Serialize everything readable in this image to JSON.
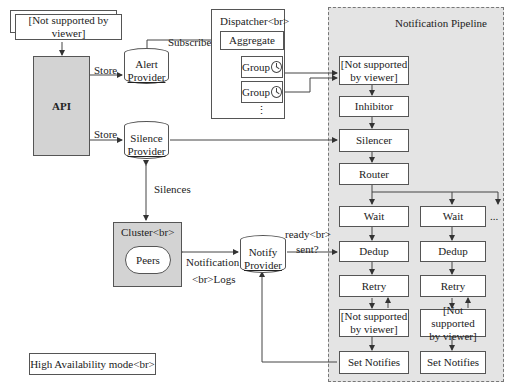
{
  "diagram": {
    "top_left_stack": {
      "label": "[Not supported by viewer]"
    },
    "api": {
      "label": "API"
    },
    "alert_provider": {
      "label_line1": "Alert",
      "label_line2": "Provider"
    },
    "silence_provider": {
      "label_line1": "Silence",
      "label_line2": "Provider"
    },
    "dispatcher": {
      "title": "Dispatcher<br>",
      "aggregate": "Aggregate",
      "groups": [
        "Group",
        "Group"
      ],
      "more": "⋮"
    },
    "cluster": {
      "title": "Cluster<br>",
      "peers": "Peers"
    },
    "notify_provider": {
      "label_line1": "Notify",
      "label_line2": "Provider"
    },
    "ha_mode": {
      "label": "High Availability mode<br>"
    },
    "edges": {
      "store_alert": "Store",
      "store_silence": "Store",
      "subscribe": "Subscribe",
      "silences": "Silences",
      "notification_logs_1": "Notification",
      "notification_logs_2": "<br>Logs",
      "ready_sent_1": "ready<br>",
      "ready_sent_2": "sent?"
    },
    "pipeline": {
      "title": "Notification Pipeline",
      "first_stage": [
        "[Not supported",
        "by viewer]"
      ],
      "inhibitor": "Inhibitor",
      "silencer": "Silencer",
      "router": "Router",
      "more": "...",
      "branches": [
        {
          "wait": "Wait",
          "dedup": "Dedup",
          "retry": "Retry",
          "unsupported": [
            "[Not supported",
            "by viewer]"
          ],
          "set_notifies": "Set Notifies"
        },
        {
          "wait": "Wait",
          "dedup": "Dedup",
          "retry": "Retry",
          "unsupported": [
            "[Not supported",
            "by viewer]"
          ],
          "set_notifies": "Set Notifies"
        }
      ]
    }
  }
}
